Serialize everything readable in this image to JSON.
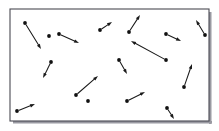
{
  "figure": {
    "title": "",
    "caption": "",
    "frame": {
      "x": 10,
      "y": 9,
      "width": 199,
      "height": 112,
      "border_color": "#4a4a52",
      "fill_color": "#ffffff",
      "shadow_color": "#9a9aa2"
    },
    "style": {
      "dot_color": "#111111",
      "dot_radius": 1.9,
      "arrow_color": "#1a1a1a",
      "arrow_width": 1.05,
      "arrow_head_length": 5.0,
      "arrow_head_width": 3.4
    }
  },
  "chart_data": {
    "type": "scatter",
    "title": "",
    "subtitle": "",
    "xlabel": "",
    "ylabel": "",
    "grid": false,
    "legend": null,
    "axis_visible": false,
    "xlim": [
      10,
      209
    ],
    "ylim": [
      9,
      121
    ],
    "point_count": 16,
    "vector_count": 16,
    "series": [
      {
        "name": "particles-with-velocity-vectors",
        "points": [
          {
            "id": "p1",
            "x": 25,
            "y": 23,
            "tip_x": 41,
            "tip_y": 49
          },
          {
            "id": "p2",
            "x": 59,
            "y": 34,
            "tip_x": 79,
            "tip_y": 43
          },
          {
            "id": "p3",
            "x": 100,
            "y": 30,
            "tip_x": 112,
            "tip_y": 22
          },
          {
            "id": "p4",
            "x": 129,
            "y": 32,
            "tip_x": 140,
            "tip_y": 15
          },
          {
            "id": "p5",
            "x": 166,
            "y": 34,
            "tip_x": 181,
            "tip_y": 41
          },
          {
            "id": "p6",
            "x": 205,
            "y": 35,
            "tip_x": 196,
            "tip_y": 20
          },
          {
            "id": "p7",
            "x": 166,
            "y": 60,
            "tip_x": 131,
            "tip_y": 41
          },
          {
            "id": "p8",
            "x": 51,
            "y": 62,
            "tip_x": 43,
            "tip_y": 78
          },
          {
            "id": "p9",
            "x": 119,
            "y": 60,
            "tip_x": 127,
            "tip_y": 74
          },
          {
            "id": "p10",
            "x": 76,
            "y": 95,
            "tip_x": 98,
            "tip_y": 76
          },
          {
            "id": "p11",
            "x": 184,
            "y": 87,
            "tip_x": 192,
            "tip_y": 64
          },
          {
            "id": "p12",
            "x": 127,
            "y": 101,
            "tip_x": 145,
            "tip_y": 92
          },
          {
            "id": "p13",
            "x": 17,
            "y": 111,
            "tip_x": 35,
            "tip_y": 104
          },
          {
            "id": "p14",
            "x": 167,
            "y": 108,
            "tip_x": 174,
            "tip_y": 119
          },
          {
            "id": "p15",
            "x": 88,
            "y": 101,
            "tip_x": 88,
            "tip_y": 101
          },
          {
            "id": "p16",
            "x": 49,
            "y": 36,
            "tip_x": 49,
            "tip_y": 36
          }
        ]
      }
    ]
  }
}
